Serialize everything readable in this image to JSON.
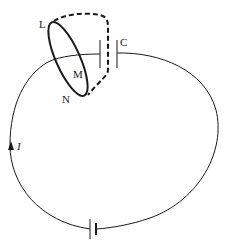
{
  "diagram": {
    "title": "",
    "labels": {
      "L": "L",
      "M": "M",
      "N": "N",
      "C": "C",
      "current": "I"
    },
    "components": [
      {
        "type": "capacitor",
        "label": "C"
      },
      {
        "type": "battery"
      },
      {
        "type": "loop",
        "points": [
          "L",
          "M",
          "N"
        ],
        "style": "solid"
      },
      {
        "type": "surface-boundary",
        "style": "dashed",
        "through": "capacitor gap"
      },
      {
        "type": "current-arrow",
        "label": "I",
        "direction": "up"
      }
    ],
    "colors": {
      "line": "#1a1a1a",
      "background": "#ffffff"
    }
  }
}
